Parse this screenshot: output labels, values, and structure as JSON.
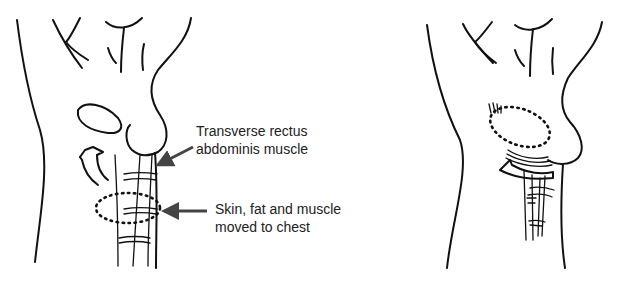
{
  "diagram": {
    "panels": [
      {
        "id": "before",
        "description": "Torso outline showing abdominal flap marked for transfer to chest",
        "labels": [
          {
            "line1": "Transverse rectus",
            "line2": "abdominis muscle"
          },
          {
            "line1": "Skin, fat and muscle",
            "line2": "moved to chest"
          }
        ]
      },
      {
        "id": "after",
        "description": "Torso outline showing flap tunneled up to the chest"
      }
    ],
    "colors": {
      "ink": "#111111",
      "background": "#ffffff",
      "arrow": "#444444"
    }
  }
}
